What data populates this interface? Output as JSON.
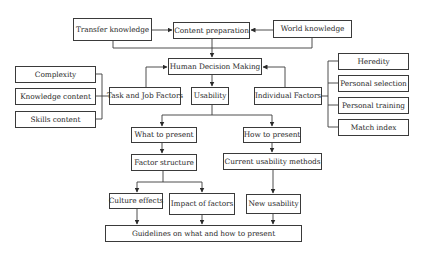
{
  "diagram": {
    "nodes": [
      {
        "id": "transfer_knowledge",
        "label": "Transfer knowledge",
        "x": 73,
        "y": 18,
        "w": 79,
        "h": 23
      },
      {
        "id": "content_preparation",
        "label": "Content preparation",
        "x": 173,
        "y": 22,
        "w": 77,
        "h": 17
      },
      {
        "id": "world_knowledge",
        "label": "World knowledge",
        "x": 273,
        "y": 20,
        "w": 79,
        "h": 18
      },
      {
        "id": "human_decision_making",
        "label": "Human Decision Making",
        "x": 168,
        "y": 58,
        "w": 94,
        "h": 17
      },
      {
        "id": "complexity",
        "label": "Complexity",
        "x": 15,
        "y": 66,
        "w": 81,
        "h": 17
      },
      {
        "id": "knowledge_content",
        "label": "Knowledge content",
        "x": 15,
        "y": 88,
        "w": 81,
        "h": 17
      },
      {
        "id": "skills_content",
        "label": "Skills content",
        "x": 15,
        "y": 111,
        "w": 81,
        "h": 17
      },
      {
        "id": "task_job_factors",
        "label": "Task and Job Factors",
        "x": 109,
        "y": 87,
        "w": 72,
        "h": 18
      },
      {
        "id": "usability",
        "label": "Usability",
        "x": 191,
        "y": 87,
        "w": 38,
        "h": 18
      },
      {
        "id": "individual_factors",
        "label": "Individual Factors",
        "x": 254,
        "y": 87,
        "w": 68,
        "h": 18
      },
      {
        "id": "heredity",
        "label": "Heredity",
        "x": 338,
        "y": 53,
        "w": 71,
        "h": 17
      },
      {
        "id": "personal_selection",
        "label": "Personal selection",
        "x": 338,
        "y": 75,
        "w": 71,
        "h": 17
      },
      {
        "id": "personal_training",
        "label": "Personal training",
        "x": 338,
        "y": 97,
        "w": 71,
        "h": 17
      },
      {
        "id": "match_index",
        "label": "Match index",
        "x": 338,
        "y": 119,
        "w": 71,
        "h": 17
      },
      {
        "id": "what_to_present",
        "label": "What to present",
        "x": 131,
        "y": 127,
        "w": 66,
        "h": 16
      },
      {
        "id": "how_to_present",
        "label": "How to present",
        "x": 243,
        "y": 127,
        "w": 58,
        "h": 16
      },
      {
        "id": "factor_structure",
        "label": "Factor structure",
        "x": 131,
        "y": 154,
        "w": 66,
        "h": 17
      },
      {
        "id": "current_usability_methods",
        "label": "Current usability methods",
        "x": 223,
        "y": 153,
        "w": 99,
        "h": 17
      },
      {
        "id": "culture_effects",
        "label": "Culture effects",
        "x": 109,
        "y": 193,
        "w": 54,
        "h": 16
      },
      {
        "id": "impact_of_factors",
        "label": "Impact of factors",
        "x": 169,
        "y": 193,
        "w": 66,
        "h": 22
      },
      {
        "id": "new_usability",
        "label": "New usability",
        "x": 246,
        "y": 194,
        "w": 55,
        "h": 20
      },
      {
        "id": "guidelines",
        "label": "Guidelines on what and how to present",
        "x": 105,
        "y": 225,
        "w": 197,
        "h": 17
      }
    ],
    "connectors": [
      {
        "name": "transfer-to-content-arrow",
        "points": [
          [
            152,
            30
          ],
          [
            172,
            30
          ]
        ],
        "arrow": true
      },
      {
        "name": "world-to-content-arrow",
        "points": [
          [
            273,
            30
          ],
          [
            251,
            30
          ]
        ],
        "arrow": true
      },
      {
        "name": "transfer-bottom-link",
        "points": [
          [
            113,
            41
          ],
          [
            113,
            48
          ],
          [
            312,
            48
          ],
          [
            312,
            38
          ]
        ],
        "arrow": false
      },
      {
        "name": "knowledge-to-hdm-arrow",
        "points": [
          [
            212,
            39
          ],
          [
            212,
            57
          ]
        ],
        "arrow": true
      },
      {
        "name": "task-to-hdm-arrow",
        "points": [
          [
            146,
            87
          ],
          [
            146,
            67
          ],
          [
            167,
            67
          ]
        ],
        "arrow": true
      },
      {
        "name": "individual-to-hdm-arrow",
        "points": [
          [
            285,
            87
          ],
          [
            285,
            67
          ],
          [
            263,
            67
          ]
        ],
        "arrow": true
      },
      {
        "name": "hdm-to-usability-arrow",
        "points": [
          [
            212,
            75
          ],
          [
            212,
            86
          ]
        ],
        "arrow": true
      },
      {
        "name": "task-bracket",
        "points": [
          [
            96,
            74
          ],
          [
            102,
            74
          ],
          [
            102,
            119
          ],
          [
            96,
            119
          ]
        ],
        "arrow": false
      },
      {
        "name": "task-bracket-mid",
        "points": [
          [
            96,
            96
          ],
          [
            109,
            96
          ]
        ],
        "arrow": false
      },
      {
        "name": "individual-bracket",
        "points": [
          [
            338,
            61
          ],
          [
            328,
            61
          ],
          [
            328,
            127
          ],
          [
            338,
            127
          ]
        ],
        "arrow": false
      },
      {
        "name": "individual-bracket-ps",
        "points": [
          [
            328,
            83
          ],
          [
            338,
            83
          ]
        ],
        "arrow": false
      },
      {
        "name": "individual-bracket-pt",
        "points": [
          [
            328,
            105
          ],
          [
            338,
            105
          ]
        ],
        "arrow": false
      },
      {
        "name": "individual-bracket-mid",
        "points": [
          [
            322,
            96
          ],
          [
            328,
            96
          ]
        ],
        "arrow": false
      },
      {
        "name": "usability-split",
        "points": [
          [
            212,
            105
          ],
          [
            212,
            115
          ]
        ],
        "arrow": false
      },
      {
        "name": "usability-split-h",
        "points": [
          [
            162,
            115
          ],
          [
            272,
            115
          ]
        ],
        "arrow": false
      },
      {
        "name": "split-to-what-arrow",
        "points": [
          [
            162,
            115
          ],
          [
            162,
            126
          ]
        ],
        "arrow": true
      },
      {
        "name": "split-to-how-arrow",
        "points": [
          [
            272,
            115
          ],
          [
            272,
            126
          ]
        ],
        "arrow": true
      },
      {
        "name": "what-to-factor-arrow",
        "points": [
          [
            162,
            143
          ],
          [
            162,
            153
          ]
        ],
        "arrow": true
      },
      {
        "name": "how-to-current-arrow",
        "points": [
          [
            272,
            143
          ],
          [
            272,
            152
          ]
        ],
        "arrow": true
      },
      {
        "name": "factor-split",
        "points": [
          [
            163,
            171
          ],
          [
            163,
            182
          ]
        ],
        "arrow": false
      },
      {
        "name": "factor-split-h",
        "points": [
          [
            137,
            182
          ],
          [
            202,
            182
          ]
        ],
        "arrow": false
      },
      {
        "name": "split-to-culture-arrow",
        "points": [
          [
            137,
            182
          ],
          [
            137,
            192
          ]
        ],
        "arrow": true
      },
      {
        "name": "split-to-impact-arrow",
        "points": [
          [
            202,
            182
          ],
          [
            202,
            192
          ]
        ],
        "arrow": true
      },
      {
        "name": "current-to-new-arrow",
        "points": [
          [
            273,
            170
          ],
          [
            273,
            193
          ]
        ],
        "arrow": true
      },
      {
        "name": "culture-to-guidelines-arrow",
        "points": [
          [
            137,
            209
          ],
          [
            137,
            224
          ]
        ],
        "arrow": true
      },
      {
        "name": "impact-to-guidelines-arrow",
        "points": [
          [
            202,
            215
          ],
          [
            202,
            224
          ]
        ],
        "arrow": true
      },
      {
        "name": "new-to-guidelines-arrow",
        "points": [
          [
            273,
            214
          ],
          [
            273,
            224
          ]
        ],
        "arrow": true
      }
    ],
    "colors": {
      "stroke": "#3a3a3a",
      "text": "#2a2a2a",
      "background": "#ffffff"
    }
  }
}
